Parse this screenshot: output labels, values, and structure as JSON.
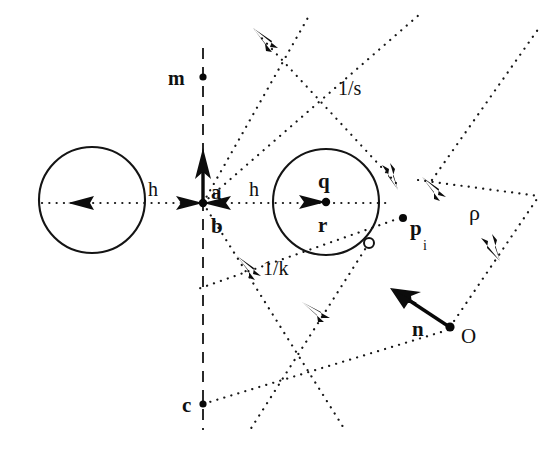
{
  "figure": {
    "background_color": "#ffffff",
    "ink_color": "#111111",
    "width": 550,
    "height": 449
  },
  "labels": {
    "m": "m",
    "a": "a",
    "b": "b",
    "c": "c",
    "q": "q",
    "r": "r",
    "n": "n",
    "origin": "O",
    "p": "p",
    "p_subscript": "i",
    "h_left": "h",
    "h_right": "h",
    "one_over_s": "1/s",
    "one_over_k": "1/k",
    "rho": "ρ"
  },
  "geometry": {
    "left_circle": {
      "cx": 92,
      "cy": 200,
      "r": 53
    },
    "right_circle": {
      "cx": 326,
      "cy": 202,
      "r": 53
    },
    "point_b": {
      "x": 203,
      "y": 203
    },
    "point_m": {
      "x": 203,
      "y": 77
    },
    "point_c": {
      "x": 203,
      "y": 404
    },
    "point_r": {
      "x": 326,
      "y": 202
    },
    "point_p_i": {
      "x": 403,
      "y": 218
    },
    "point_O": {
      "x": 450,
      "y": 327
    },
    "tangency_marker": {
      "x": 369,
      "y": 243,
      "r": 5
    },
    "vector_a": {
      "x1": 203,
      "y1": 203,
      "x2": 203,
      "y2": 153
    },
    "vector_n": {
      "x1": 450,
      "y1": 327,
      "x2": 392,
      "y2": 289
    },
    "dashed_axis": {
      "x": 203,
      "y1": 48,
      "y2": 430
    },
    "horizontal_axis_y": 203
  }
}
